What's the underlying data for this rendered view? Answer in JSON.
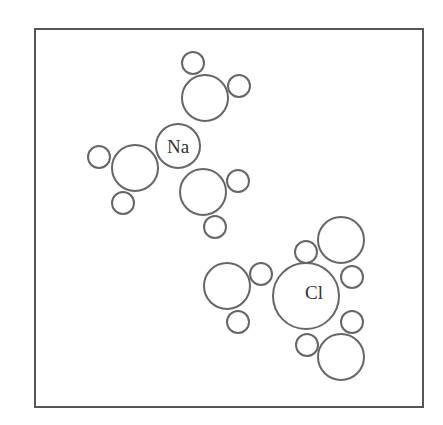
{
  "diagram": {
    "frame": {
      "x": 35,
      "y": 29,
      "width": 388,
      "height": 378
    },
    "colors": {
      "stroke": "#666666",
      "frame": "#555555",
      "text": "#333333"
    },
    "ions": [
      {
        "name": "sodium-ion",
        "label": "Na",
        "cx": 178,
        "cy": 146,
        "r": 22,
        "label_x": 178,
        "label_y": 153
      },
      {
        "name": "chloride-ion",
        "label": "Cl",
        "cx": 306,
        "cy": 296,
        "r": 33,
        "label_x": 314,
        "label_y": 299
      }
    ],
    "water_molecules": [
      {
        "group": "na",
        "oxygen": {
          "cx": 205,
          "cy": 98,
          "r": 23
        },
        "hydrogens": [
          {
            "cx": 193,
            "cy": 63,
            "r": 11
          },
          {
            "cx": 239,
            "cy": 86,
            "r": 11
          }
        ]
      },
      {
        "group": "na",
        "oxygen": {
          "cx": 135,
          "cy": 168,
          "r": 23
        },
        "hydrogens": [
          {
            "cx": 99,
            "cy": 157,
            "r": 11
          },
          {
            "cx": 123,
            "cy": 203,
            "r": 11
          }
        ]
      },
      {
        "group": "na",
        "oxygen": {
          "cx": 203,
          "cy": 192,
          "r": 23
        },
        "hydrogens": [
          {
            "cx": 238,
            "cy": 181,
            "r": 11
          },
          {
            "cx": 215,
            "cy": 227,
            "r": 11
          }
        ]
      },
      {
        "group": "cl",
        "oxygen": {
          "cx": 227,
          "cy": 286,
          "r": 23
        },
        "hydrogens": [
          {
            "cx": 261,
            "cy": 274,
            "r": 11
          },
          {
            "cx": 238,
            "cy": 322,
            "r": 11
          }
        ]
      },
      {
        "group": "cl",
        "oxygen": {
          "cx": 341,
          "cy": 240,
          "r": 23
        },
        "hydrogens": [
          {
            "cx": 306,
            "cy": 252,
            "r": 11
          },
          {
            "cx": 352,
            "cy": 277,
            "r": 11
          }
        ]
      },
      {
        "group": "cl",
        "oxygen": {
          "cx": 341,
          "cy": 357,
          "r": 23
        },
        "hydrogens": [
          {
            "cx": 352,
            "cy": 322,
            "r": 11
          },
          {
            "cx": 307,
            "cy": 345,
            "r": 11
          }
        ]
      }
    ]
  }
}
